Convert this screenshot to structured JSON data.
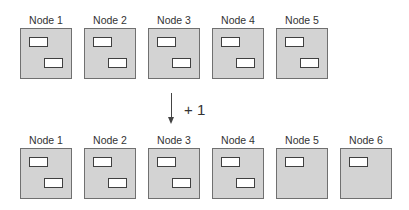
{
  "before": {
    "nodes": [
      {
        "label": "Node 1",
        "partitions": 2
      },
      {
        "label": "Node 2",
        "partitions": 2
      },
      {
        "label": "Node 3",
        "partitions": 2
      },
      {
        "label": "Node 4",
        "partitions": 2
      },
      {
        "label": "Node 5",
        "partitions": 2
      }
    ]
  },
  "transition": {
    "label": "+ 1"
  },
  "after": {
    "nodes": [
      {
        "label": "Node 1",
        "partitions": 2
      },
      {
        "label": "Node 2",
        "partitions": 2
      },
      {
        "label": "Node 3",
        "partitions": 2
      },
      {
        "label": "Node 4",
        "partitions": 2
      },
      {
        "label": "Node 5",
        "partitions": 1
      },
      {
        "label": "Node 6",
        "partitions": 1
      }
    ]
  },
  "colors": {
    "node_fill": "#d3d3d3",
    "node_border": "#707070",
    "partition_fill": "#ffffff",
    "partition_border": "#404040"
  }
}
